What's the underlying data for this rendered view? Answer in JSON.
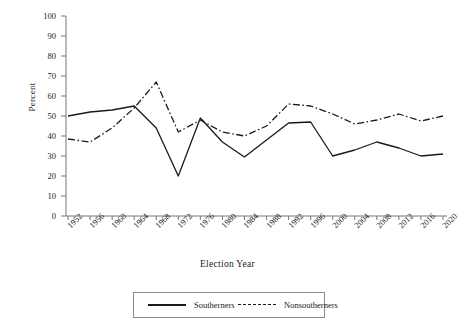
{
  "chart_data": {
    "type": "line",
    "title": "",
    "xlabel": "Election Year",
    "ylabel": "Percent",
    "categories": [
      "1952",
      "1956",
      "1960",
      "1964",
      "1968",
      "1972",
      "1976",
      "1980",
      "1984",
      "1988",
      "1992",
      "1996",
      "2000",
      "2004",
      "2008",
      "2012",
      "2016",
      "2020"
    ],
    "ylim": [
      0,
      100
    ],
    "yticks": [
      0,
      10,
      20,
      30,
      40,
      50,
      60,
      70,
      80,
      90,
      100
    ],
    "grid": false,
    "legend_position": "bottom",
    "series": [
      {
        "name": "Southerners",
        "style": "solid",
        "color": "#1a1a1a",
        "values": [
          50,
          52,
          53,
          55,
          44,
          20,
          49,
          37,
          29.5,
          38,
          46.5,
          47,
          30,
          33,
          37,
          34,
          30,
          31
        ]
      },
      {
        "name": "Nonsoutherners",
        "style": "dash-dot",
        "color": "#1a1a1a",
        "values": [
          38.5,
          37,
          44,
          54,
          67,
          42,
          48,
          42,
          40,
          45,
          56,
          55,
          51,
          46,
          48,
          51,
          47.5,
          50
        ]
      }
    ]
  },
  "axes": {
    "y_title": "Percent",
    "x_title": "Election Year"
  },
  "legend": {
    "items": [
      {
        "label": "Southerners",
        "style": "solid"
      },
      {
        "label": "Nonsoutherners",
        "style": "dash-dot"
      }
    ]
  }
}
